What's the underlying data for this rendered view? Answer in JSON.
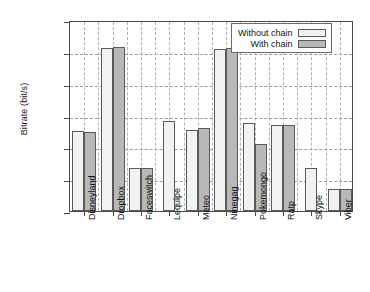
{
  "chart_data": {
    "type": "bar",
    "title": "",
    "xlabel": "",
    "ylabel": "Bitrate (bit/s)",
    "ylim": [
      0,
      6000
    ],
    "ytick_labels": [
      "0",
      "1000",
      "2000",
      "3000",
      "4000",
      "5000",
      "6000"
    ],
    "ytick_values": [
      0,
      1000,
      2000,
      3000,
      4000,
      5000,
      6000
    ],
    "grid": "horizontal-and-vertical-dashed",
    "legend_position": "top-right",
    "categories": [
      "Disneyland",
      "Dropbox",
      "Faceswitch",
      "Lequipe",
      "Meteo",
      "Ninegag",
      "Pokemongo",
      "Ratp",
      "Skype",
      "Viber"
    ],
    "series": [
      {
        "name": "Without chain",
        "color": "#f2f2f2",
        "values": [
          2500,
          5120,
          1355,
          2820,
          2530,
          5085,
          2780,
          2690,
          1350,
          680
        ]
      },
      {
        "name": "With chain",
        "color": "#b8b8b8",
        "values": [
          2485,
          5155,
          1365,
          0,
          2620,
          5125,
          2100,
          2695,
          0,
          685
        ]
      }
    ]
  },
  "legend": {
    "items": [
      {
        "label": "Without chain",
        "style": "plain"
      },
      {
        "label": "With chain",
        "style": "hatch"
      }
    ]
  }
}
